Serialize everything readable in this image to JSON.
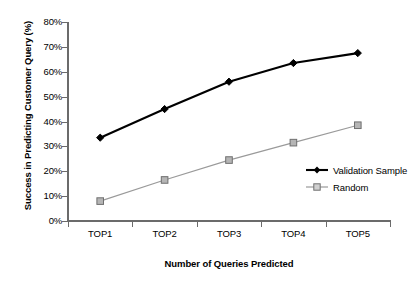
{
  "chart_data": {
    "type": "line",
    "title": "",
    "xlabel": "Number of Queries Predicted",
    "ylabel": "Success in Predicting Customer Query (%)",
    "categories": [
      "TOP1",
      "TOP2",
      "TOP3",
      "TOP4",
      "TOP5"
    ],
    "ylim": [
      0,
      80
    ],
    "ytick_labels": [
      "80%",
      "70%",
      "60%",
      "50%",
      "40%",
      "30%",
      "20%",
      "10%",
      "0%"
    ],
    "ytick_values": [
      80,
      70,
      60,
      50,
      40,
      30,
      20,
      10,
      0
    ],
    "grid": false,
    "legend_position": "inside-right",
    "series": [
      {
        "name": "Validation Sample",
        "values": [
          33.5,
          45.0,
          56.0,
          63.5,
          67.5
        ],
        "color": "#000000",
        "marker": "diamond"
      },
      {
        "name": "Random",
        "values": [
          8.0,
          16.5,
          24.5,
          31.5,
          38.5
        ],
        "color": "#9a9a9a",
        "marker": "square"
      }
    ]
  },
  "legend": {
    "items": [
      {
        "label": "Validation Sample"
      },
      {
        "label": "Random"
      }
    ]
  }
}
